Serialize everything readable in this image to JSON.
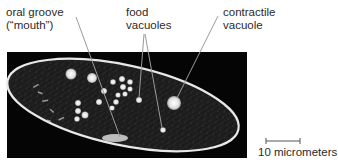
{
  "figure": {
    "labels": {
      "oral_groove_line1": "oral groove",
      "oral_groove_line2": "(“mouth”)",
      "food_line1": "food",
      "food_line2": "vacuoles",
      "contractile_line1": "contractile",
      "contractile_line2": "vacuole"
    },
    "scale_bar": {
      "label": "10 micrometers"
    },
    "colors": {
      "background": "#ffffff",
      "photo_bg": "#050505",
      "cell_outline": "#e8e8e8",
      "leader_line": "#9a9a9a",
      "text": "#2a2a2a"
    }
  }
}
